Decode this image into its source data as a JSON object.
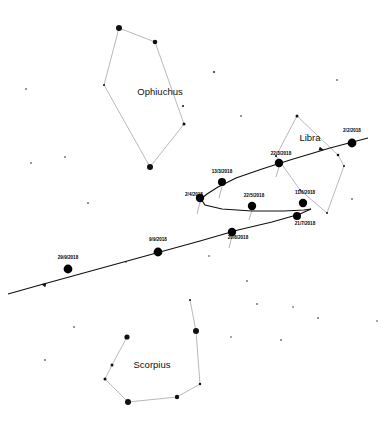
{
  "chart_data": {
    "type": "scatter",
    "title": "",
    "subtitle": "",
    "xlabel": "",
    "ylabel": "",
    "grid": false,
    "legend_position": "none",
    "constellations": [
      {
        "name": "Ophiuchus",
        "label_x": 160,
        "label_y": 92,
        "stars": [
          {
            "x": 119,
            "y": 28,
            "r": 3.0
          },
          {
            "x": 155,
            "y": 42,
            "r": 2.3
          },
          {
            "x": 104,
            "y": 85,
            "r": 1.0
          },
          {
            "x": 184,
            "y": 124,
            "r": 1.5
          },
          {
            "x": 150,
            "y": 167,
            "r": 3.0
          },
          {
            "x": 183,
            "y": 106,
            "r": 1.0
          }
        ],
        "segments": [
          [
            0,
            1
          ],
          [
            0,
            2
          ],
          [
            1,
            3
          ],
          [
            2,
            4
          ],
          [
            3,
            4
          ]
        ]
      },
      {
        "name": "Libra",
        "label_x": 310,
        "label_y": 138,
        "stars": [
          {
            "x": 297,
            "y": 116,
            "r": 1.5
          },
          {
            "x": 276,
            "y": 156,
            "r": 1.0
          },
          {
            "x": 338,
            "y": 155,
            "r": 1.3
          },
          {
            "x": 344,
            "y": 166,
            "r": 1.0
          },
          {
            "x": 327,
            "y": 213,
            "r": 1.0
          },
          {
            "x": 300,
            "y": 190,
            "r": 0.9
          }
        ],
        "segments": [
          [
            0,
            1
          ],
          [
            0,
            2
          ],
          [
            2,
            3
          ],
          [
            3,
            4
          ],
          [
            1,
            5
          ],
          [
            5,
            4
          ]
        ]
      },
      {
        "name": "Scorpius",
        "label_x": 152,
        "label_y": 365,
        "stars": [
          {
            "x": 127,
            "y": 337,
            "r": 2.6
          },
          {
            "x": 112,
            "y": 365,
            "r": 1.5
          },
          {
            "x": 105,
            "y": 379,
            "r": 1.5
          },
          {
            "x": 128,
            "y": 402,
            "r": 3.0
          },
          {
            "x": 177,
            "y": 397,
            "r": 2.2
          },
          {
            "x": 200,
            "y": 384,
            "r": 1.2
          },
          {
            "x": 196,
            "y": 331,
            "r": 3.0
          },
          {
            "x": 190,
            "y": 300,
            "r": 1.0
          }
        ],
        "segments": [
          [
            0,
            1
          ],
          [
            1,
            2
          ],
          [
            2,
            3
          ],
          [
            3,
            4
          ],
          [
            4,
            5
          ],
          [
            5,
            6
          ],
          [
            6,
            7
          ]
        ]
      }
    ],
    "background_stars": [
      {
        "x": 26,
        "y": 89,
        "r": 0.8
      },
      {
        "x": 65,
        "y": 157,
        "r": 0.8
      },
      {
        "x": 31,
        "y": 163,
        "r": 0.8
      },
      {
        "x": 88,
        "y": 203,
        "r": 0.8
      },
      {
        "x": 214,
        "y": 72,
        "r": 0.9
      },
      {
        "x": 241,
        "y": 116,
        "r": 0.8
      },
      {
        "x": 337,
        "y": 80,
        "r": 0.8
      },
      {
        "x": 352,
        "y": 199,
        "r": 0.8
      },
      {
        "x": 247,
        "y": 281,
        "r": 0.8
      },
      {
        "x": 257,
        "y": 304,
        "r": 0.8
      },
      {
        "x": 318,
        "y": 318,
        "r": 0.8
      },
      {
        "x": 377,
        "y": 321,
        "r": 0.7
      },
      {
        "x": 231,
        "y": 337,
        "r": 0.7
      },
      {
        "x": 74,
        "y": 327,
        "r": 0.8
      },
      {
        "x": 281,
        "y": 340,
        "r": 0.8
      },
      {
        "x": 45,
        "y": 360,
        "r": 0.8
      },
      {
        "x": 293,
        "y": 307,
        "r": 0.7
      },
      {
        "x": 126,
        "y": 262,
        "r": 0.7
      },
      {
        "x": 209,
        "y": 256,
        "r": 0.7
      }
    ],
    "planet_path": {
      "stroke_color": "#111111",
      "forward_upper": [
        [
          368,
          138
        ],
        [
          330,
          148
        ],
        [
          290,
          160
        ],
        [
          262,
          169
        ],
        [
          236,
          178
        ],
        [
          218,
          187
        ],
        [
          207,
          194
        ],
        [
          201,
          199
        ]
      ],
      "retrograde_back": [
        [
          201,
          199
        ],
        [
          205,
          205
        ],
        [
          222,
          209
        ],
        [
          252,
          211
        ],
        [
          284,
          211
        ],
        [
          304,
          210
        ],
        [
          311,
          209
        ]
      ],
      "forward_lower": [
        [
          311,
          209
        ],
        [
          300,
          214
        ],
        [
          272,
          222
        ],
        [
          238,
          230
        ],
        [
          200,
          241
        ],
        [
          160,
          252
        ],
        [
          120,
          263
        ],
        [
          80,
          274
        ],
        [
          40,
          285
        ],
        [
          8,
          294
        ]
      ]
    },
    "date_markers": [
      {
        "date": "2/2/2018",
        "x": 352,
        "y": 143,
        "label_x": 352,
        "label_y": 131,
        "r": 4.4
      },
      {
        "date": "22/3/2018",
        "x": 279,
        "y": 163,
        "label_x": 281,
        "label_y": 154,
        "r": 4.2
      },
      {
        "date": "13/3/2018",
        "x": 222,
        "y": 182,
        "label_x": 222,
        "label_y": 172,
        "r": 4.0
      },
      {
        "date": "2/4/2018",
        "x": 200,
        "y": 198,
        "label_x": 194,
        "label_y": 195,
        "r": 4.2
      },
      {
        "date": "22/5/2018",
        "x": 252,
        "y": 206,
        "label_x": 254,
        "label_y": 196,
        "r": 4.2
      },
      {
        "date": "11/6/2018",
        "x": 303,
        "y": 203,
        "label_x": 305,
        "label_y": 193,
        "r": 4.2
      },
      {
        "date": "21/7/2018",
        "x": 297,
        "y": 216,
        "label_x": 305,
        "label_y": 224,
        "r": 4.0
      },
      {
        "date": "20/8/2018",
        "x": 232,
        "y": 232,
        "label_x": 238,
        "label_y": 238,
        "r": 4.2
      },
      {
        "date": "9/9/2018",
        "x": 158,
        "y": 252,
        "label_x": 158,
        "label_y": 240,
        "r": 4.4
      },
      {
        "date": "29/9/2018",
        "x": 68,
        "y": 269,
        "label_x": 68,
        "label_y": 258,
        "r": 4.4
      }
    ],
    "tick_marks": [
      {
        "x1": 222,
        "y1": 186,
        "x2": 219,
        "y2": 198
      },
      {
        "x1": 279,
        "y1": 167,
        "x2": 276,
        "y2": 177
      },
      {
        "x1": 232,
        "y1": 236,
        "x2": 229,
        "y2": 248
      },
      {
        "x1": 252,
        "y1": 210,
        "x2": 249,
        "y2": 220
      },
      {
        "x1": 200,
        "y1": 202,
        "x2": 197,
        "y2": 214
      }
    ],
    "direction_arrows": [
      {
        "x": 41,
        "y": 284,
        "angle": 196
      },
      {
        "x": 324,
        "y": 150,
        "angle": 16
      }
    ]
  }
}
